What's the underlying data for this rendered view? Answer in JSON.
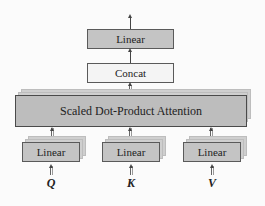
{
  "diagram": {
    "top_linear": {
      "label": "Linear"
    },
    "concat": {
      "label": "Concat"
    },
    "attention": {
      "label": "Scaled Dot-Product Attention"
    },
    "input_linears": [
      {
        "label": "Linear",
        "input": "Q"
      },
      {
        "label": "Linear",
        "input": "K"
      },
      {
        "label": "Linear",
        "input": "V"
      }
    ],
    "colors": {
      "linear_fill": "#c4c4c4",
      "concat_fill": "#f4f4f4",
      "attention_fill": "#bdbdbd",
      "border": "#5a5a5a",
      "arrow": "#444444"
    }
  }
}
